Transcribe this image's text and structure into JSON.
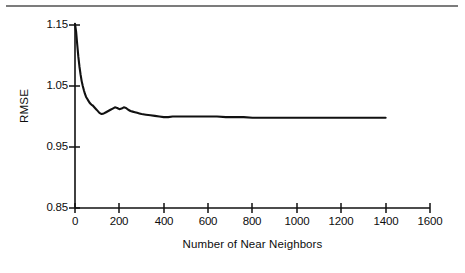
{
  "figure": {
    "background_color": "#ffffff",
    "ink_color": "#111111",
    "rule_color": "#7c7c7c",
    "has_top_rule": true
  },
  "chart_data": {
    "type": "line",
    "title": "",
    "subtitle": "",
    "xlabel": "Number of Near Neighbors",
    "ylabel": "RMSE",
    "xlim": [
      0,
      1600
    ],
    "ylim": [
      0.85,
      1.15
    ],
    "xticks": [
      0,
      200,
      400,
      600,
      800,
      1000,
      1200,
      1400,
      1600
    ],
    "xticklabels": [
      "0",
      "200",
      "400",
      "600",
      "800",
      "1000",
      "1200",
      "1400",
      "1600"
    ],
    "yticks": [
      0.85,
      0.95,
      1.05,
      1.15
    ],
    "yticklabels": [
      "0.85",
      "0.95",
      "1.05",
      "1.15"
    ],
    "grid": false,
    "legend": null,
    "legend_position": "none",
    "annotations": [],
    "series": [
      {
        "name": "RMSE vs number of near neighbors",
        "color": "#111111",
        "line_width": 2.1,
        "x": [
          0,
          5,
          10,
          15,
          20,
          25,
          30,
          35,
          40,
          45,
          50,
          55,
          60,
          65,
          70,
          75,
          80,
          85,
          90,
          95,
          100,
          110,
          120,
          130,
          140,
          150,
          160,
          170,
          180,
          190,
          200,
          210,
          220,
          230,
          240,
          250,
          260,
          270,
          280,
          290,
          300,
          320,
          340,
          360,
          380,
          400,
          420,
          440,
          460,
          480,
          500,
          520,
          540,
          560,
          580,
          600,
          640,
          680,
          720,
          760,
          800,
          840,
          880,
          920,
          960,
          1000,
          1040,
          1080,
          1120,
          1160,
          1200,
          1240,
          1280,
          1320,
          1360,
          1400
        ],
        "y": [
          1.152,
          1.139,
          1.118,
          1.098,
          1.082,
          1.069,
          1.058,
          1.05,
          1.043,
          1.037,
          1.032,
          1.029,
          1.026,
          1.023,
          1.021,
          1.019,
          1.018,
          1.016,
          1.014,
          1.012,
          1.01,
          1.006,
          1.004,
          1.005,
          1.007,
          1.009,
          1.011,
          1.013,
          1.015,
          1.014,
          1.012,
          1.013,
          1.015,
          1.014,
          1.011,
          1.009,
          1.008,
          1.007,
          1.006,
          1.005,
          1.004,
          1.003,
          1.002,
          1.001,
          1.0,
          0.999,
          0.999,
          1.0,
          1.0,
          1.0,
          1.0,
          1.0,
          1.0,
          1.0,
          1.0,
          1.0,
          1.0,
          0.999,
          0.999,
          0.999,
          0.998,
          0.998,
          0.998,
          0.998,
          0.998,
          0.998,
          0.998,
          0.998,
          0.998,
          0.998,
          0.998,
          0.998,
          0.998,
          0.998,
          0.998,
          0.998
        ]
      }
    ]
  }
}
